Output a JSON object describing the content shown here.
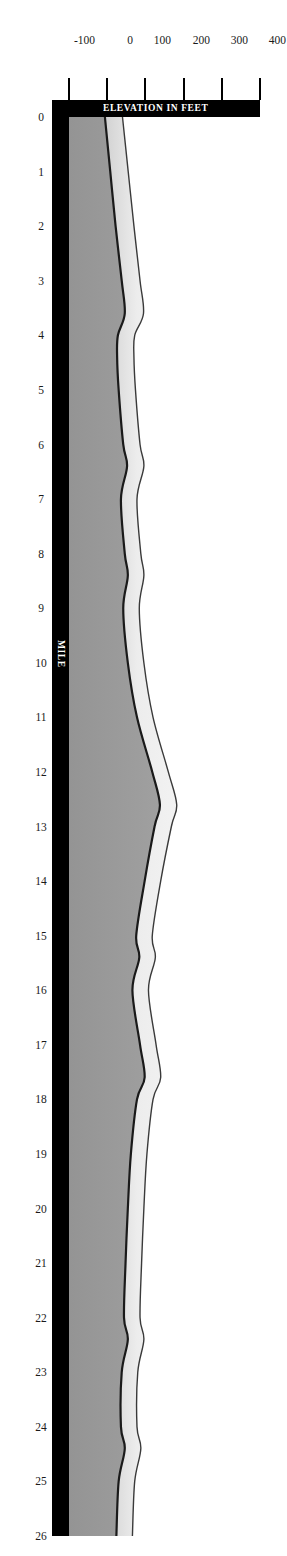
{
  "figure": {
    "kind": "elevation-profile",
    "background_color": "#ffffff"
  },
  "axes": {
    "x_title": "MILE",
    "y_title": "ELEVATION IN FEET",
    "axis_bar_color": "#000000",
    "axis_title_color": "#ffffff",
    "tick_label_color": "#1a1a1a"
  },
  "colors": {
    "profile_line": "#1a1a1a",
    "below_fill": "#9a9a9a",
    "above_band": "#e8e8e8",
    "band_shade_dark": "#b4b4b4",
    "axis_black": "#000000"
  },
  "chart_data": {
    "type": "area",
    "title": "",
    "subtitle": "",
    "xlabel": "MILE",
    "ylabel": "ELEVATION IN FEET",
    "xlim": [
      0,
      26
    ],
    "ylim": [
      -100,
      400
    ],
    "grid": false,
    "legend": null,
    "orientation": "rotated-90-clockwise",
    "x_ticks": [
      0,
      1,
      2,
      3,
      4,
      5,
      6,
      7,
      8,
      9,
      10,
      11,
      12,
      13,
      14,
      15,
      16,
      17,
      18,
      19,
      20,
      21,
      22,
      23,
      24,
      25,
      26
    ],
    "x_tick_labels": [
      "0",
      "1",
      "2",
      "3",
      "4",
      "5",
      "6",
      "7",
      "8",
      "9",
      "10",
      "11",
      "12",
      "13",
      "14",
      "15",
      "16",
      "17",
      "18",
      "19",
      "20",
      "21",
      "22",
      "23",
      "24",
      "25",
      "26"
    ],
    "y_ticks": [
      400,
      300,
      200,
      100,
      0,
      -100
    ],
    "y_tick_labels": [
      "400",
      "300",
      "200",
      "100",
      "0",
      "-100"
    ],
    "series": [
      {
        "name": "water-surface-profile",
        "description": "Upper boundary of the light band (water surface / high elevation line)",
        "x": [
          0,
          1,
          2,
          3,
          3.6,
          4,
          4.4,
          5,
          6,
          6.4,
          7,
          8,
          8.4,
          9,
          10,
          11,
          12,
          12.6,
          13,
          14,
          15,
          15.4,
          16,
          17,
          17.6,
          18,
          19,
          20,
          21,
          22,
          22.4,
          23,
          24,
          24.4,
          25,
          26
        ],
        "values": [
          40,
          55,
          70,
          86,
          95,
          72,
          70,
          74,
          86,
          96,
          78,
          88,
          96,
          84,
          96,
          120,
          160,
          182,
          168,
          140,
          118,
          126,
          108,
          128,
          140,
          120,
          104,
          96,
          90,
          86,
          96,
          80,
          78,
          88,
          72,
          66
        ]
      },
      {
        "name": "bed-profile",
        "description": "Dark elevation line, top of the gray fill (channel bed / ground surface)",
        "x": [
          0,
          1,
          2,
          3,
          3.6,
          4,
          4.4,
          5,
          6,
          6.4,
          7,
          8,
          8.4,
          9,
          10,
          11,
          12,
          12.6,
          13,
          14,
          15,
          15.4,
          16,
          17,
          17.6,
          18,
          19,
          20,
          21,
          22,
          22.4,
          23,
          24,
          24.4,
          25,
          26
        ],
        "values": [
          -6,
          8,
          22,
          38,
          46,
          28,
          26,
          30,
          42,
          52,
          36,
          46,
          54,
          42,
          54,
          78,
          118,
          138,
          124,
          98,
          76,
          84,
          66,
          86,
          98,
          78,
          62,
          54,
          48,
          44,
          54,
          38,
          36,
          46,
          30,
          24
        ]
      }
    ]
  }
}
